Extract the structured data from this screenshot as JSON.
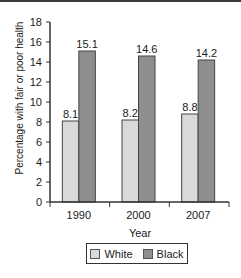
{
  "chart_data": {
    "type": "bar",
    "title": "",
    "xlabel": "Year",
    "ylabel": "Percentage with fair or poor health",
    "categories": [
      "1990",
      "2000",
      "2007"
    ],
    "series": [
      {
        "name": "White",
        "values": [
          8.1,
          8.2,
          8.8
        ],
        "color": "#d9d9d9"
      },
      {
        "name": "Black",
        "values": [
          15.1,
          14.6,
          14.2
        ],
        "color": "#8e8e8e"
      }
    ],
    "value_labels": {
      "White": [
        "8.1",
        "8.2",
        "8.8"
      ],
      "Black": [
        "15.1",
        "14.6",
        "14.2"
      ]
    },
    "yticks": [
      0,
      2,
      4,
      6,
      8,
      10,
      12,
      14,
      16,
      18
    ],
    "ylim": [
      0,
      18
    ],
    "grid": false,
    "legend_position": "bottom"
  },
  "legend": {
    "items": [
      {
        "label": "White",
        "color": "#d9d9d9"
      },
      {
        "label": "Black",
        "color": "#8e8e8e"
      }
    ]
  },
  "colors": {
    "axis": "#333333",
    "bar_border": "#444444"
  }
}
